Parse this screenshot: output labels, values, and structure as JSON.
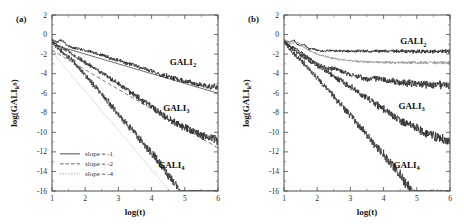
{
  "figure": {
    "panels": [
      {
        "tag": "(a)",
        "xlabel": "log(t)",
        "ylabel": "log(GALIs)",
        "ylabel_parts": {
          "pre": "log(GALI",
          "sub": "k",
          "post": "s)"
        },
        "xlim": [
          1,
          6
        ],
        "ylim": [
          -16,
          2
        ],
        "xticks": [
          1,
          2,
          3,
          4,
          5,
          6
        ],
        "yticks": [
          2,
          0,
          -2,
          -4,
          -6,
          -8,
          -10,
          -12,
          -14,
          -16
        ],
        "xtick_labels": [
          "1",
          "2",
          "3",
          "4",
          "5",
          "6"
        ],
        "ytick_labels": [
          "2",
          "0",
          "-2",
          "-4",
          "-6",
          "-8",
          "-10",
          "-12",
          "-14",
          "-16"
        ],
        "legend": {
          "position": "lower-left",
          "items": [
            {
              "label": "slope = -1",
              "style": "solid",
              "color": "#3a3a3a"
            },
            {
              "label": "slope = -2",
              "style": "dashed",
              "color": "#555555"
            },
            {
              "label": "slope = -4",
              "style": "dotted",
              "color": "#9a9a9a"
            }
          ]
        },
        "annotations": [
          {
            "text": "GALI",
            "sub": "2",
            "x": 4.55,
            "y": -3.1
          },
          {
            "text": "GALI",
            "sub": "3",
            "x": 4.35,
            "y": -7.8
          },
          {
            "text": "GALI",
            "sub": "4",
            "x": 4.2,
            "y": -13.6
          }
        ],
        "reference_lines": [
          {
            "name": "slope-minus-1",
            "style": "solid",
            "color": "#4a4a4a",
            "x0": 1.0,
            "y0": -1.0,
            "x1": 6.0,
            "y1": -6.0
          },
          {
            "name": "slope-minus-2",
            "style": "dashed",
            "color": "#5a5a5a",
            "x0": 1.0,
            "y0": -1.6,
            "x1": 6.0,
            "y1": -11.6
          },
          {
            "name": "slope-minus-4",
            "style": "dotted",
            "color": "#a5a5a5",
            "x0": 1.0,
            "y0": -1.8,
            "x1": 4.7,
            "y1": -16.6
          }
        ],
        "series": [
          {
            "name": "GALI2",
            "color": "#2e2e2e",
            "width": 0.85,
            "noise": 0.22,
            "anchors": [
              [
                1.0,
                -0.5
              ],
              [
                1.15,
                -0.75
              ],
              [
                1.3,
                -0.55
              ],
              [
                1.45,
                -1.05
              ],
              [
                1.6,
                -1.35
              ],
              [
                1.8,
                -1.45
              ],
              [
                2.0,
                -1.6
              ],
              [
                2.5,
                -2.1
              ],
              [
                3.0,
                -2.65
              ],
              [
                3.5,
                -3.2
              ],
              [
                4.0,
                -3.75
              ],
              [
                4.5,
                -4.3
              ],
              [
                5.0,
                -4.75
              ],
              [
                5.5,
                -5.15
              ],
              [
                6.0,
                -5.4
              ]
            ]
          },
          {
            "name": "GALI3",
            "color": "#333333",
            "width": 0.85,
            "noise": 0.32,
            "anchors": [
              [
                1.0,
                -0.6
              ],
              [
                1.2,
                -1.2
              ],
              [
                1.4,
                -1.5
              ],
              [
                1.6,
                -2.0
              ],
              [
                1.8,
                -2.4
              ],
              [
                2.0,
                -2.85
              ],
              [
                2.5,
                -3.9
              ],
              [
                3.0,
                -5.0
              ],
              [
                3.5,
                -6.2
              ],
              [
                4.0,
                -7.4
              ],
              [
                4.5,
                -8.6
              ],
              [
                5.0,
                -9.5
              ],
              [
                5.5,
                -10.3
              ],
              [
                6.0,
                -10.9
              ]
            ]
          },
          {
            "name": "GALI4",
            "color": "#3a3a3a",
            "width": 0.85,
            "noise": 0.42,
            "anchors": [
              [
                1.0,
                -0.7
              ],
              [
                1.2,
                -1.5
              ],
              [
                1.4,
                -2.1
              ],
              [
                1.6,
                -2.6
              ],
              [
                1.8,
                -3.4
              ],
              [
                2.0,
                -4.2
              ],
              [
                2.4,
                -5.7
              ],
              [
                2.8,
                -7.3
              ],
              [
                3.2,
                -8.9
              ],
              [
                3.6,
                -10.5
              ],
              [
                4.0,
                -12.1
              ],
              [
                4.4,
                -13.8
              ],
              [
                4.7,
                -15.3
              ],
              [
                4.85,
                -15.95
              ],
              [
                5.1,
                -16.0
              ],
              [
                6.0,
                -16.0
              ]
            ]
          }
        ]
      },
      {
        "tag": "(b)",
        "xlabel": "log(t)",
        "ylabel": "log(GALIs)",
        "ylabel_parts": {
          "pre": "log(GALI",
          "sub": "k",
          "post": "s)"
        },
        "xlim": [
          1,
          6
        ],
        "ylim": [
          -16,
          2
        ],
        "xticks": [
          1,
          2,
          3,
          4,
          5,
          6
        ],
        "yticks": [
          2,
          0,
          -2,
          -4,
          -6,
          -8,
          -10,
          -12,
          -14,
          -16
        ],
        "xtick_labels": [
          "1",
          "2",
          "3",
          "4",
          "5",
          "6"
        ],
        "ytick_labels": [
          "2",
          "0",
          "-2",
          "-4",
          "-6",
          "-8",
          "-10",
          "-12",
          "-14",
          "-16"
        ],
        "legend": null,
        "annotations": [
          {
            "text": "GALI",
            "sub": "2",
            "x": 4.5,
            "y": -1.0
          },
          {
            "text": "GALI",
            "sub": "3",
            "x": 4.45,
            "y": -7.6
          },
          {
            "text": "GALI",
            "sub": "4",
            "x": 4.3,
            "y": -13.6
          }
        ],
        "reference_lines": [],
        "series": [
          {
            "name": "GALI2-saturated",
            "color": "#2a2a2a",
            "width": 0.85,
            "noise": 0.16,
            "anchors": [
              [
                1.0,
                -0.5
              ],
              [
                1.15,
                -0.8
              ],
              [
                1.3,
                -0.6
              ],
              [
                1.45,
                -1.15
              ],
              [
                1.6,
                -1.0
              ],
              [
                1.75,
                -1.5
              ],
              [
                1.9,
                -1.45
              ],
              [
                2.1,
                -1.7
              ],
              [
                2.4,
                -1.65
              ],
              [
                2.8,
                -1.7
              ],
              [
                3.2,
                -1.68
              ],
              [
                3.6,
                -1.72
              ],
              [
                4.0,
                -1.68
              ],
              [
                4.5,
                -1.72
              ],
              [
                5.0,
                -1.7
              ],
              [
                5.5,
                -1.72
              ],
              [
                6.0,
                -1.7
              ]
            ]
          },
          {
            "name": "GALI2-plateau-gray",
            "color": "#9e9e9e",
            "width": 1.0,
            "noise": 0.12,
            "anchors": [
              [
                1.0,
                -0.55
              ],
              [
                1.2,
                -0.95
              ],
              [
                1.4,
                -0.8
              ],
              [
                1.6,
                -1.3
              ],
              [
                1.8,
                -1.7
              ],
              [
                2.0,
                -2.0
              ],
              [
                2.3,
                -2.3
              ],
              [
                2.6,
                -2.5
              ],
              [
                3.0,
                -2.68
              ],
              [
                3.4,
                -2.78
              ],
              [
                3.8,
                -2.82
              ],
              [
                4.2,
                -2.85
              ],
              [
                4.6,
                -2.86
              ],
              [
                5.0,
                -2.87
              ],
              [
                5.5,
                -2.88
              ],
              [
                6.0,
                -2.88
              ]
            ]
          },
          {
            "name": "GALI3",
            "color": "#333333",
            "width": 0.85,
            "noise": 0.3,
            "anchors": [
              [
                1.0,
                -0.6
              ],
              [
                1.2,
                -1.3
              ],
              [
                1.4,
                -1.45
              ],
              [
                1.6,
                -2.1
              ],
              [
                1.8,
                -2.5
              ],
              [
                2.0,
                -2.95
              ],
              [
                2.3,
                -3.45
              ],
              [
                2.6,
                -3.55
              ],
              [
                3.0,
                -4.1
              ],
              [
                3.5,
                -4.6
              ],
              [
                3.8,
                -4.45
              ],
              [
                4.2,
                -4.7
              ],
              [
                4.6,
                -4.95
              ],
              [
                5.2,
                -5.05
              ],
              [
                5.6,
                -5.15
              ],
              [
                6.0,
                -5.25
              ]
            ]
          },
          {
            "name": "GALI3-steep",
            "color": "#2f2f2f",
            "width": 0.85,
            "noise": 0.35,
            "anchors": [
              [
                1.0,
                -0.65
              ],
              [
                1.3,
                -1.6
              ],
              [
                1.6,
                -2.3
              ],
              [
                1.9,
                -3.0
              ],
              [
                2.2,
                -3.6
              ],
              [
                2.6,
                -4.5
              ],
              [
                3.0,
                -5.3
              ],
              [
                3.5,
                -6.5
              ],
              [
                4.0,
                -7.6
              ],
              [
                4.5,
                -8.8
              ],
              [
                5.0,
                -9.6
              ],
              [
                5.5,
                -10.4
              ],
              [
                6.0,
                -10.9
              ]
            ]
          },
          {
            "name": "GALI4",
            "color": "#3a3a3a",
            "width": 0.85,
            "noise": 0.45,
            "anchors": [
              [
                1.0,
                -0.75
              ],
              [
                1.2,
                -1.6
              ],
              [
                1.4,
                -2.3
              ],
              [
                1.6,
                -2.95
              ],
              [
                1.8,
                -3.7
              ],
              [
                2.0,
                -4.45
              ],
              [
                2.4,
                -5.95
              ],
              [
                2.8,
                -7.5
              ],
              [
                3.2,
                -9.1
              ],
              [
                3.6,
                -10.7
              ],
              [
                4.0,
                -12.3
              ],
              [
                4.4,
                -13.9
              ],
              [
                4.7,
                -15.4
              ],
              [
                4.85,
                -15.95
              ],
              [
                5.2,
                -16.0
              ],
              [
                6.0,
                -16.0
              ]
            ]
          }
        ]
      }
    ]
  },
  "chart_data": {
    "type": "line",
    "title": "",
    "panels": [
      {
        "tag": "(a)",
        "description": "Regular orbit: GALI_k decay as power laws in time on log-log axes",
        "xlabel": "log(t)",
        "ylabel": "log(GALIs)",
        "xlim": [
          1,
          6
        ],
        "ylim": [
          -16,
          2
        ],
        "xticks": [
          1,
          2,
          3,
          4,
          5,
          6
        ],
        "yticks": [
          2,
          0,
          -2,
          -4,
          -6,
          -8,
          -10,
          -12,
          -14,
          -16
        ],
        "grid": false,
        "legend_position": "lower-left",
        "legend_entries": [
          "slope = -1",
          "slope = -2",
          "slope = -4"
        ],
        "series": [
          {
            "name": "GALI2",
            "slope": -1,
            "x": [
              1,
              2,
              3,
              4,
              5,
              6
            ],
            "values": [
              -0.5,
              -1.6,
              -2.65,
              -3.75,
              -4.75,
              -5.4
            ]
          },
          {
            "name": "GALI3",
            "slope": -2,
            "x": [
              1,
              2,
              3,
              4,
              5,
              6
            ],
            "values": [
              -0.6,
              -2.85,
              -5.0,
              -7.4,
              -9.5,
              -10.9
            ]
          },
          {
            "name": "GALI4",
            "slope": -4,
            "x": [
              1,
              2,
              3,
              4,
              5,
              6
            ],
            "values": [
              -0.7,
              -4.2,
              -8.9,
              -12.1,
              -16.0,
              -16.0
            ]
          }
        ],
        "reference_slopes": [
          -1,
          -2,
          -4
        ]
      },
      {
        "tag": "(b)",
        "description": "GALI_k evolution showing saturation of GALI2 and continued decay of GALI3 and GALI4",
        "xlabel": "log(t)",
        "ylabel": "log(GALIs)",
        "xlim": [
          1,
          6
        ],
        "ylim": [
          -16,
          2
        ],
        "xticks": [
          1,
          2,
          3,
          4,
          5,
          6
        ],
        "yticks": [
          2,
          0,
          -2,
          -4,
          -6,
          -8,
          -10,
          -12,
          -14,
          -16
        ],
        "grid": false,
        "legend_position": "none",
        "series": [
          {
            "name": "GALI2-saturated",
            "x": [
              1,
              2,
              3,
              4,
              5,
              6
            ],
            "values": [
              -0.5,
              -1.7,
              -1.68,
              -1.68,
              -1.7,
              -1.7
            ]
          },
          {
            "name": "GALI2-plateau-gray",
            "x": [
              1,
              2,
              3,
              4,
              5,
              6
            ],
            "values": [
              -0.55,
              -2.0,
              -2.68,
              -2.84,
              -2.87,
              -2.88
            ]
          },
          {
            "name": "GALI3",
            "x": [
              1,
              2,
              3,
              4,
              5,
              6
            ],
            "values": [
              -0.6,
              -2.95,
              -4.1,
              -4.6,
              -5.05,
              -5.25
            ]
          },
          {
            "name": "GALI3-steep",
            "x": [
              1,
              2,
              3,
              4,
              5,
              6
            ],
            "values": [
              -0.65,
              -3.2,
              -5.3,
              -7.6,
              -9.6,
              -10.9
            ]
          },
          {
            "name": "GALI4",
            "x": [
              1,
              2,
              3,
              4,
              5,
              6
            ],
            "values": [
              -0.75,
              -4.45,
              -9.1,
              -12.3,
              -16.0,
              -16.0
            ]
          }
        ]
      }
    ]
  }
}
